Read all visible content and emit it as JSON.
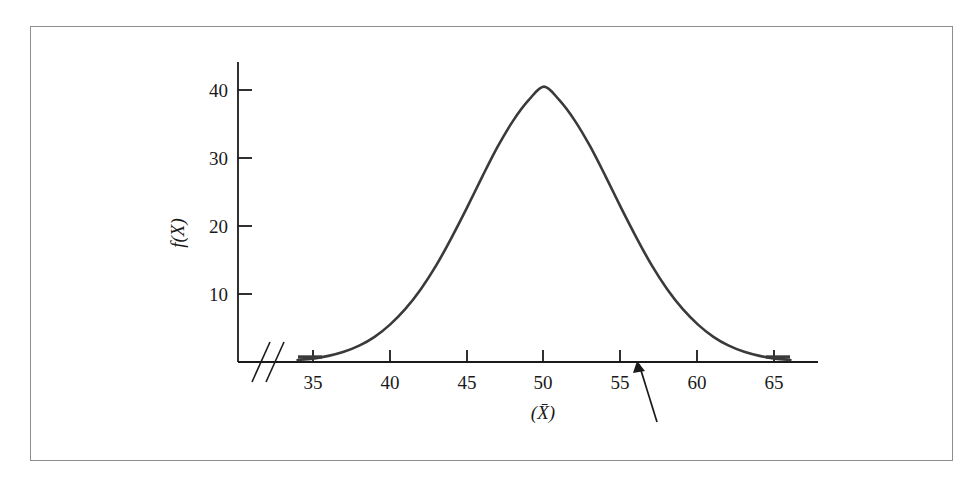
{
  "figure": {
    "frame_color": "#8d8d8d",
    "background": "#ffffff",
    "curve_color": "#3a3a3a",
    "axis_color": "#1a1a1a",
    "axis_break_symbol": "//",
    "arrow_annotation": {
      "name": "pointer-arrow",
      "points_to_x_value": 56,
      "tip_x": 637,
      "tip_y": 363,
      "tail_x": 657,
      "tail_y": 422
    }
  },
  "chart_data": {
    "type": "line",
    "title": "",
    "subtitle": "",
    "xlabel": "(X̄)",
    "ylabel": "f(X)",
    "xlabel_plain": "(X-bar)",
    "ylabel_plain": "f(X)",
    "xlim": [
      33.5,
      68
    ],
    "ylim": [
      0,
      44
    ],
    "x_ticks": [
      35,
      40,
      45,
      50,
      55,
      60,
      65
    ],
    "x_tick_labels": [
      "35",
      "40",
      "45",
      "50",
      "55",
      "60",
      "65"
    ],
    "y_ticks": [
      10,
      20,
      30,
      40
    ],
    "y_tick_labels": [
      "10",
      "20",
      "30",
      "40"
    ],
    "grid": false,
    "legend": false,
    "axis_break": true,
    "distribution": {
      "kind": "normal",
      "mean": 50,
      "peak_value": 40.5,
      "sigma": 5.0
    },
    "x": [
      34,
      35,
      36,
      37,
      38,
      39,
      40,
      41,
      42,
      43,
      44,
      45,
      46,
      47,
      48,
      49,
      50,
      51,
      52,
      53,
      54,
      55,
      56,
      57,
      58,
      59,
      60,
      61,
      62,
      63,
      64,
      65,
      66
    ],
    "values": [
      0.3,
      0.5,
      0.9,
      1.5,
      2.4,
      3.7,
      5.5,
      7.8,
      10.7,
      14.2,
      18.3,
      22.7,
      27.3,
      31.7,
      35.5,
      38.5,
      40.5,
      38.5,
      35.5,
      31.7,
      27.3,
      22.7,
      18.3,
      14.2,
      10.7,
      7.8,
      5.5,
      3.7,
      2.4,
      1.5,
      0.9,
      0.5,
      0.3
    ],
    "series": [
      {
        "name": "sampling distribution of the mean",
        "values": [
          0.3,
          0.5,
          0.9,
          1.5,
          2.4,
          3.7,
          5.5,
          7.8,
          10.7,
          14.2,
          18.3,
          22.7,
          27.3,
          31.7,
          35.5,
          38.5,
          40.5,
          38.5,
          35.5,
          31.7,
          27.3,
          22.7,
          18.3,
          14.2,
          10.7,
          7.8,
          5.5,
          3.7,
          2.4,
          1.5,
          0.9,
          0.5,
          0.3
        ]
      }
    ],
    "annotations": [
      {
        "type": "arrow",
        "x": 56,
        "y": 0,
        "text": ""
      }
    ],
    "markers": [
      {
        "type": "axis-segment",
        "x": 35,
        "label": "35"
      },
      {
        "type": "axis-segment",
        "x": 65,
        "label": "65"
      }
    ]
  }
}
